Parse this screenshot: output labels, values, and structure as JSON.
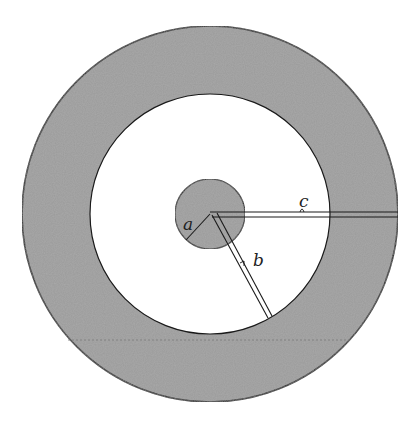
{
  "figure": {
    "type": "concentric-circles-cross-section",
    "colors": {
      "background": "#ffffff",
      "shaded": "#9a9a9a",
      "stroke": "#1a1a1a"
    },
    "geometry": {
      "center": [
        210,
        214
      ],
      "outer_radius": 188,
      "inner_radius": 120,
      "core_radius": 35
    },
    "labels": {
      "a": "a",
      "b": "b",
      "c": "c"
    }
  }
}
